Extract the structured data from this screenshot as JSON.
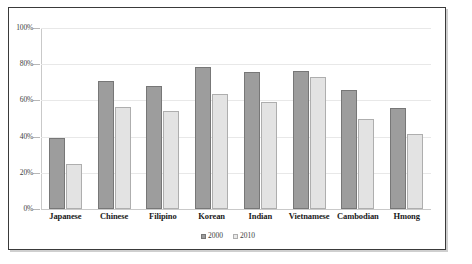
{
  "chart_data": {
    "type": "bar",
    "title": "",
    "subtitle": "",
    "xlabel": "",
    "ylabel": "",
    "ylim": [
      0,
      100
    ],
    "ytick_labels": [
      "100%",
      "80%",
      "60%",
      "40%",
      "20%",
      "0%"
    ],
    "ytick_values": [
      100,
      80,
      60,
      40,
      20,
      0
    ],
    "grid": true,
    "legend_position": "bottom-center",
    "categories": [
      "Japanese",
      "Chinese",
      "Filipino",
      "Korean",
      "Indian",
      "Vietnamese",
      "Cambodian",
      "Hmong"
    ],
    "series": [
      {
        "name": "2000",
        "color": "#9d9d9d",
        "values": [
          39,
          71,
          68,
          78.5,
          75.5,
          76.5,
          66,
          56
        ]
      },
      {
        "name": "2010",
        "color": "#e3e3e3",
        "values": [
          25,
          56.5,
          54,
          63.5,
          59,
          73,
          50,
          41.5
        ]
      }
    ]
  },
  "colors": {
    "series_2000": "#9d9d9d",
    "series_2000_border": "#777777",
    "series_2010": "#e3e3e3",
    "series_2010_border": "#aeaeae",
    "gridline": "#e8e8e8",
    "axis": "#c9c9c9",
    "frame_border": "#3a3a3a",
    "background": "#ffffff",
    "label_text": "#1b1b1b"
  }
}
